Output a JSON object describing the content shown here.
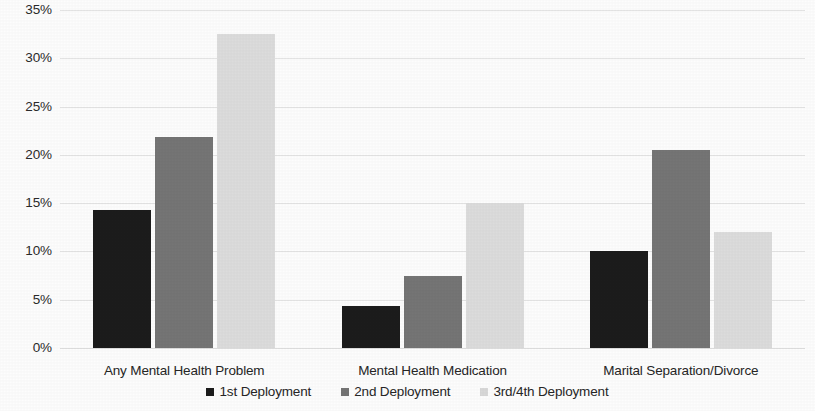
{
  "chart_data": {
    "type": "bar",
    "title": "",
    "subtitle": "",
    "xlabel": "",
    "ylabel": "",
    "categories": [
      "Any Mental Health Problem",
      "Mental Health Medication",
      "Marital Separation/Divorce"
    ],
    "series": [
      {
        "name": "1st Deployment",
        "color": "#1c1c1c",
        "values": [
          14.3,
          4.4,
          10.0
        ]
      },
      {
        "name": "2nd Deployment",
        "color": "#757575",
        "values": [
          21.8,
          7.5,
          20.5
        ]
      },
      {
        "name": "3rd/4th Deployment",
        "color": "#dcdcdc",
        "values": [
          32.5,
          15.0,
          12.0
        ]
      }
    ],
    "ylim": [
      0,
      35
    ],
    "ytick_step": 5,
    "ytick_labels": [
      "35%",
      "30%",
      "25%",
      "20%",
      "15%",
      "10%",
      "5%",
      "0%"
    ],
    "ytick_values": [
      35,
      30,
      25,
      20,
      15,
      10,
      5,
      0
    ],
    "grid": "horizontal",
    "legend_position": "bottom",
    "value_suffix": "%"
  },
  "legend": {
    "items": [
      {
        "label": "1st Deployment"
      },
      {
        "label": "2nd Deployment"
      },
      {
        "label": "3rd/4th Deployment"
      }
    ]
  }
}
